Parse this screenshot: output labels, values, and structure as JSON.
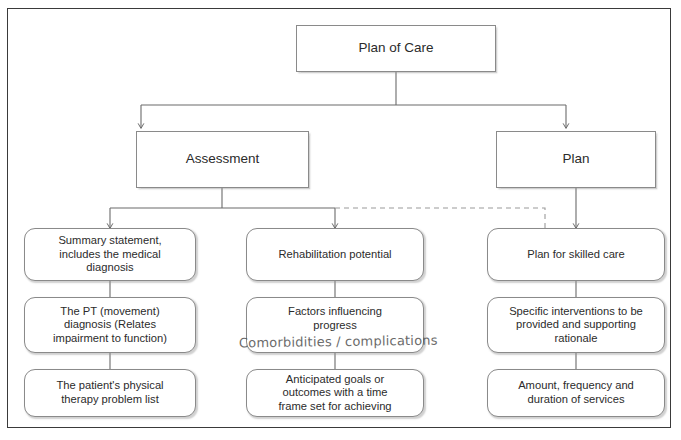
{
  "diagram": {
    "title_node": {
      "id": "plan-of-care",
      "label": "Plan of Care"
    },
    "branch_nodes": [
      {
        "id": "assessment",
        "label": "Assessment"
      },
      {
        "id": "plan",
        "label": "Plan"
      }
    ],
    "columns": [
      {
        "id": "assessment-column",
        "parent": "assessment",
        "items": [
          {
            "id": "summary-statement",
            "label": "Summary statement,\nincludes the medical\ndiagnosis"
          },
          {
            "id": "pt-movement-diagnosis",
            "label": "The PT (movement)\ndiagnosis (Relates\nimpairment to function)"
          },
          {
            "id": "problem-list",
            "label": "The patient's physical\ntherapy problem list"
          }
        ]
      },
      {
        "id": "rehab-column",
        "parent": "assessment",
        "items": [
          {
            "id": "rehabilitation-potential",
            "label": "Rehabilitation potential"
          },
          {
            "id": "factors-influencing-progress",
            "label": "Factors influencing\nprogress"
          },
          {
            "id": "anticipated-goals",
            "label": "Anticipated goals or\noutcomes with a time\nframe set for achieving"
          }
        ]
      },
      {
        "id": "plan-column",
        "parent": "plan",
        "items": [
          {
            "id": "plan-for-skilled-care",
            "label": "Plan for skilled care"
          },
          {
            "id": "specific-interventions",
            "label": "Specific interventions to be\nprovided and supporting\nrationale"
          },
          {
            "id": "amount-frequency-duration",
            "label": "Amount, frequency and\nduration of services"
          }
        ]
      }
    ],
    "annotations": [
      {
        "id": "handwritten-comorbidities",
        "label": "Comorbidities / complications",
        "style": "handwritten"
      }
    ],
    "colors": {
      "frame_border": "#3a3a3a",
      "node_border": "#8a8a8a",
      "connector": "#6b6b6b",
      "dashed_connector": "#9a9a9a",
      "text": "#2b2b2b",
      "background": "#ffffff"
    },
    "connector_legend": {
      "solid": "solid arrow connector",
      "dashed": "dashed cross-branch connector"
    }
  }
}
